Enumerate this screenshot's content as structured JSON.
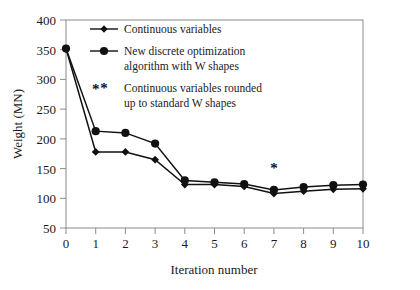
{
  "chart_data": {
    "type": "line",
    "title": "",
    "xlabel": "Iteration number",
    "ylabel": "Weight (MN)",
    "xlim": [
      0,
      10
    ],
    "ylim": [
      50,
      400
    ],
    "xticks": [
      "0",
      "1",
      "2",
      "3",
      "4",
      "5",
      "6",
      "7",
      "8",
      "9",
      "10"
    ],
    "yticks": [
      "50",
      "100",
      "150",
      "200",
      "250",
      "300",
      "350",
      "400"
    ],
    "grid": false,
    "legend_position": "top-left-inside",
    "x": [
      0,
      1,
      2,
      3,
      4,
      5,
      6,
      7,
      8,
      9,
      10
    ],
    "series": [
      {
        "name": "Continuous variables",
        "marker": "diamond",
        "color": "#111111",
        "values": [
          352,
          178,
          178,
          165,
          123,
          123,
          120,
          108,
          112,
          115,
          116
        ]
      },
      {
        "name": "New discrete optimization algorithm with W shapes",
        "marker": "circle",
        "color": "#111111",
        "values": [
          352,
          213,
          210,
          192,
          130,
          127,
          124,
          114,
          119,
          122,
          123
        ]
      }
    ],
    "annotations": [
      {
        "symbol": "*",
        "x": 1,
        "y": 275,
        "note": "star marker near iteration 1"
      },
      {
        "symbol": "*",
        "x": 7,
        "y": 142,
        "note": "star marker above iteration 7"
      }
    ]
  },
  "legend": {
    "entries": [
      {
        "marker": "diamond-line",
        "lines": [
          "Continuous variables"
        ]
      },
      {
        "marker": "circle-line",
        "lines": [
          "New discrete optimization",
          "algorithm with W shapes"
        ]
      },
      {
        "marker": "star",
        "lines": [
          "Continuous variables rounded",
          "up to standard W shapes"
        ]
      }
    ]
  },
  "axes": {
    "x_title": "Iteration number",
    "y_title": "Weight (MN)",
    "x_tick_labels": [
      "0",
      "1",
      "2",
      "3",
      "4",
      "5",
      "6",
      "7",
      "8",
      "9",
      "10"
    ],
    "y_tick_labels": [
      "50",
      "100",
      "150",
      "200",
      "250",
      "300",
      "350",
      "400"
    ]
  },
  "colors": {
    "line": "#111111",
    "axis": "#8a8a8a",
    "text": "#1a1a1a",
    "background": "#ffffff"
  }
}
